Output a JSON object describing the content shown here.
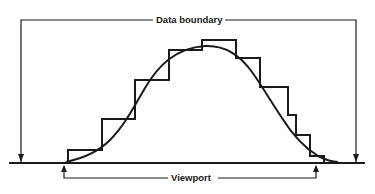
{
  "diagram": {
    "type": "viewport-vs-data-boundary",
    "labels": {
      "data_boundary": "Data boundary",
      "viewport": "Viewport"
    },
    "colors": {
      "ink": "#1a1a1a",
      "background": "#ffffff"
    },
    "elements": {
      "histogram_steps": 11,
      "smooth_curve": "bell-shaped curve overlaid on stepped histogram",
      "baseline": "horizontal axis line",
      "data_boundary_bracket": "arrows pointing down to baseline at outer left and right",
      "viewport_bracket": "arrows pointing up to baseline at inner left and right"
    }
  }
}
